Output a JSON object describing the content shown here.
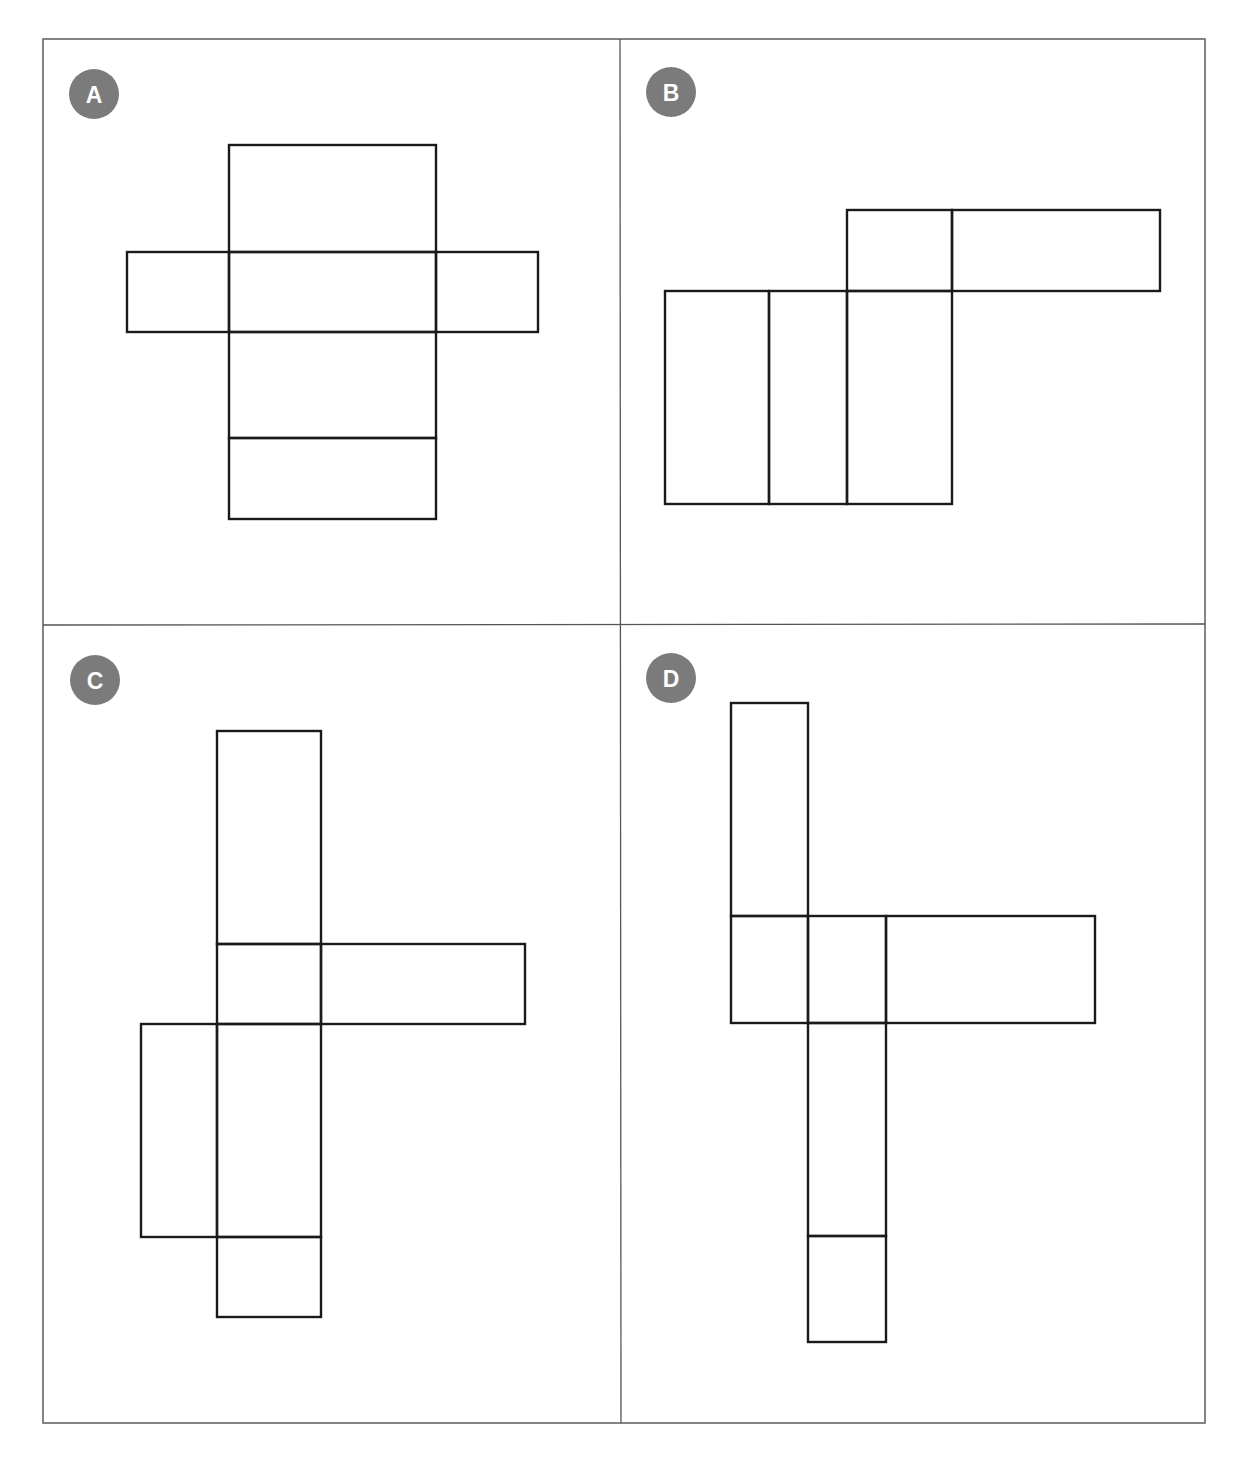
{
  "figure": {
    "colors": {
      "badge": "#7b7b7b",
      "badge_text": "#ffffff",
      "line": "#1a1a1a",
      "frame": "#666666"
    },
    "panels": [
      {
        "id": "A",
        "label": "A",
        "faces": [
          {
            "x": 229,
            "y": 145,
            "w": 207,
            "h": 107
          },
          {
            "x": 229,
            "y": 252,
            "w": 207,
            "h": 80
          },
          {
            "x": 229,
            "y": 332,
            "w": 207,
            "h": 106
          },
          {
            "x": 229,
            "y": 438,
            "w": 207,
            "h": 81
          },
          {
            "x": 127,
            "y": 252,
            "w": 102,
            "h": 80
          },
          {
            "x": 436,
            "y": 252,
            "w": 102,
            "h": 80
          }
        ]
      },
      {
        "id": "B",
        "label": "B",
        "faces": [
          {
            "x": 665,
            "y": 291,
            "w": 104,
            "h": 213
          },
          {
            "x": 769,
            "y": 291,
            "w": 78,
            "h": 213
          },
          {
            "x": 847,
            "y": 291,
            "w": 105,
            "h": 213
          },
          {
            "x": 847,
            "y": 210,
            "w": 105,
            "h": 81
          },
          {
            "x": 952,
            "y": 210,
            "w": 208,
            "h": 81
          }
        ]
      },
      {
        "id": "C",
        "label": "C",
        "faces": [
          {
            "x": 217,
            "y": 731,
            "w": 104,
            "h": 213
          },
          {
            "x": 217,
            "y": 944,
            "w": 104,
            "h": 80
          },
          {
            "x": 217,
            "y": 1024,
            "w": 104,
            "h": 213
          },
          {
            "x": 217,
            "y": 1237,
            "w": 104,
            "h": 80
          },
          {
            "x": 321,
            "y": 944,
            "w": 204,
            "h": 80
          },
          {
            "x": 141,
            "y": 1024,
            "w": 76,
            "h": 213
          }
        ]
      },
      {
        "id": "D",
        "label": "D",
        "faces": [
          {
            "x": 731,
            "y": 703,
            "w": 77,
            "h": 213
          },
          {
            "x": 731,
            "y": 916,
            "w": 77,
            "h": 107
          },
          {
            "x": 808,
            "y": 916,
            "w": 78,
            "h": 107
          },
          {
            "x": 886,
            "y": 916,
            "w": 209,
            "h": 107
          },
          {
            "x": 808,
            "y": 1023,
            "w": 78,
            "h": 213
          },
          {
            "x": 808,
            "y": 1236,
            "w": 78,
            "h": 106
          }
        ]
      }
    ]
  }
}
